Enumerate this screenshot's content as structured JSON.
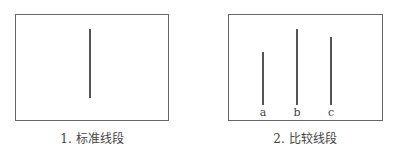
{
  "figure": {
    "panels": [
      {
        "id": "standard",
        "caption": "1. 标准线段",
        "lines": [
          {
            "label": "",
            "x": 90,
            "y1": 29,
            "y2": 98
          }
        ]
      },
      {
        "id": "comparison",
        "caption": "2. 比较线段",
        "lines": [
          {
            "label": "a",
            "x": 263,
            "y1": 52,
            "y2": 105
          },
          {
            "label": "b",
            "x": 297,
            "y1": 29,
            "y2": 105
          },
          {
            "label": "c",
            "x": 331,
            "y1": 37,
            "y2": 105
          }
        ]
      }
    ],
    "colors": {
      "border": "#666666",
      "line": "#555555",
      "text": "#444444"
    }
  }
}
